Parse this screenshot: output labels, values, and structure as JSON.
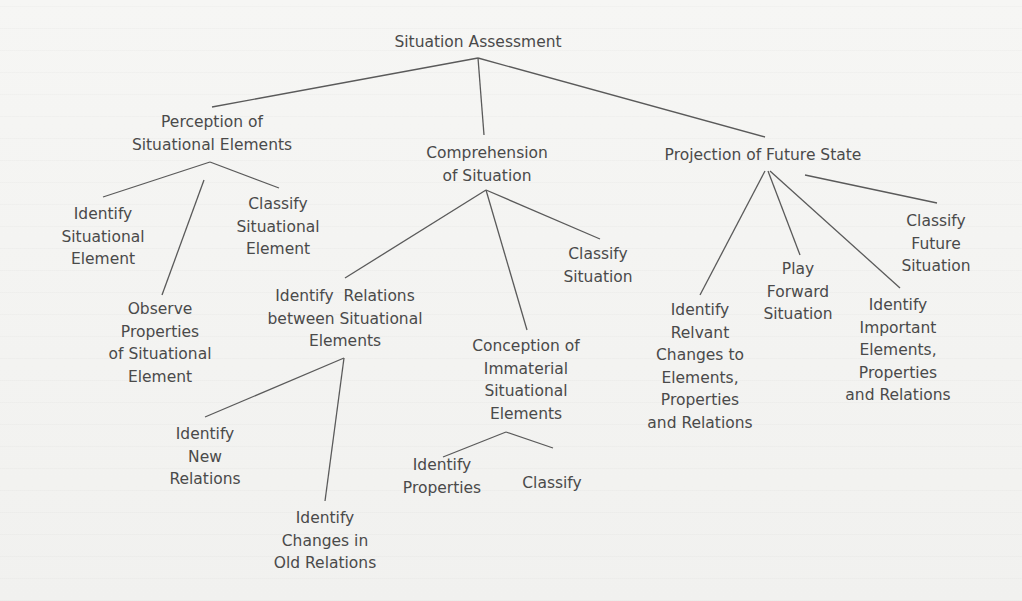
{
  "diagram": {
    "title": "Situation Assessment",
    "colors": {
      "text": "#4a4a4a",
      "lines": "#5a5a5a",
      "background": "#f4f4f2"
    },
    "nodes": {
      "root": {
        "lines": [
          "Situation Assessment"
        ]
      },
      "perception": {
        "lines": [
          "Perception of",
          "Situational Elements"
        ]
      },
      "comprehension": {
        "lines": [
          "Comprehension",
          "of Situation"
        ]
      },
      "projection": {
        "lines": [
          "Projection of Future State"
        ]
      },
      "identify_situational_element": {
        "lines": [
          "Identify",
          "Situational",
          "Element"
        ]
      },
      "classify_situational_element": {
        "lines": [
          "Classify",
          "Situational",
          "Element"
        ]
      },
      "observe_properties": {
        "lines": [
          "Observe",
          "Properties",
          "of Situational",
          "Element"
        ]
      },
      "identify_relations": {
        "lines": [
          "Identify  Relations",
          "between Situational",
          "Elements"
        ]
      },
      "classify_situation": {
        "lines": [
          "Classify",
          "Situation"
        ]
      },
      "conception_immaterial": {
        "lines": [
          "Conception of",
          "Immaterial",
          "Situational",
          "Elements"
        ]
      },
      "identify_new_relations": {
        "lines": [
          "Identify",
          "New",
          "Relations"
        ]
      },
      "identify_changes_old_relations": {
        "lines": [
          "Identify",
          "Changes in",
          "Old Relations"
        ]
      },
      "identify_properties": {
        "lines": [
          "Identify",
          "Properties"
        ]
      },
      "classify": {
        "lines": [
          "Classify"
        ]
      },
      "identify_relvant_changes": {
        "lines": [
          "Identify",
          "Relvant",
          "Changes to",
          "Elements,",
          "Properties",
          "and Relations"
        ]
      },
      "play_forward_situation": {
        "lines": [
          "Play",
          "Forward",
          "Situation"
        ]
      },
      "identify_important_elements": {
        "lines": [
          "Identify",
          "Important",
          "Elements,",
          "Properties",
          "and Relations"
        ]
      },
      "classify_future_situation": {
        "lines": [
          "Classify",
          "Future",
          "Situation"
        ]
      }
    },
    "edges": [
      [
        "root",
        "perception"
      ],
      [
        "root",
        "comprehension"
      ],
      [
        "root",
        "projection"
      ],
      [
        "perception",
        "identify_situational_element"
      ],
      [
        "perception",
        "observe_properties"
      ],
      [
        "perception",
        "classify_situational_element"
      ],
      [
        "comprehension",
        "identify_relations"
      ],
      [
        "comprehension",
        "conception_immaterial"
      ],
      [
        "comprehension",
        "classify_situation"
      ],
      [
        "identify_relations",
        "identify_new_relations"
      ],
      [
        "identify_relations",
        "identify_changes_old_relations"
      ],
      [
        "conception_immaterial",
        "identify_properties"
      ],
      [
        "conception_immaterial",
        "classify"
      ],
      [
        "projection",
        "identify_relvant_changes"
      ],
      [
        "projection",
        "play_forward_situation"
      ],
      [
        "projection",
        "identify_important_elements"
      ],
      [
        "projection",
        "classify_future_situation"
      ]
    ]
  }
}
